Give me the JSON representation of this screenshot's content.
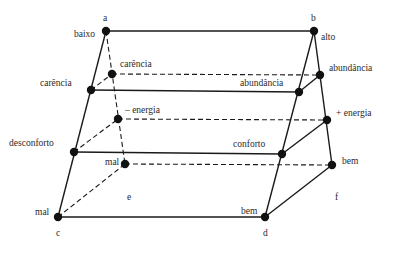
{
  "diagram": {
    "type": "trapezoidal prism lattice (semantic cube)",
    "vertices": {
      "a": "a",
      "b": "b",
      "c": "c",
      "d": "d",
      "e": "e",
      "f": "f"
    },
    "nodes": {
      "top_left": {
        "label": "baixo",
        "x": 106,
        "y": 31
      },
      "top_right": {
        "label": "alto",
        "x": 314,
        "y": 31
      },
      "back_left_1": {
        "label": "carência",
        "x": 112,
        "y": 74
      },
      "back_right_1": {
        "label": "abundância",
        "x": 320,
        "y": 75
      },
      "front_left_1": {
        "label": "carência",
        "x": 91,
        "y": 90
      },
      "front_right_1": {
        "label": "abundância",
        "x": 299,
        "y": 92
      },
      "back_left_2": {
        "label": "– energia",
        "x": 118,
        "y": 119
      },
      "back_right_2": {
        "label": "+ energia",
        "x": 327,
        "y": 120
      },
      "front_left_2": {
        "label": "desconforto",
        "x": 74,
        "y": 152
      },
      "front_right_2": {
        "label": "conforto",
        "x": 282,
        "y": 154
      },
      "back_left_3": {
        "label": "mal",
        "x": 125,
        "y": 164
      },
      "back_right_3": {
        "label": "bem",
        "x": 332,
        "y": 165
      },
      "front_left_3": {
        "label": "mal",
        "x": 58,
        "y": 217
      },
      "front_right_3": {
        "label": "bem",
        "x": 265,
        "y": 217
      }
    },
    "colors": {
      "line": "#1a1a1a",
      "node": "#111111",
      "text": "#2a2a2a",
      "background": "#ffffff"
    }
  }
}
